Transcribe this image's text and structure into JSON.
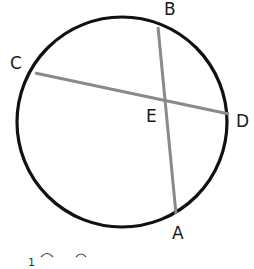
{
  "diagram": {
    "type": "circle-intersecting-chords",
    "circle": {
      "cx": 122,
      "cy": 122,
      "r": 105,
      "stroke": "#111111"
    },
    "chords": [
      {
        "name": "CD",
        "from": "C",
        "to": "D",
        "stroke": "#8a8a8a"
      },
      {
        "name": "BA",
        "from": "B",
        "to": "A",
        "stroke": "#8a8a8a"
      }
    ],
    "points": {
      "C": {
        "x": 35,
        "y": 73
      },
      "D": {
        "x": 229,
        "y": 114
      },
      "B": {
        "x": 158,
        "y": 27
      },
      "A": {
        "x": 176,
        "y": 214
      },
      "E": {
        "x": 166,
        "y": 99
      }
    },
    "labels": {
      "A": "A",
      "B": "B",
      "C": "C",
      "D": "D",
      "E": "E"
    },
    "footer_partial_text": "1 ⌒ ⌒"
  }
}
